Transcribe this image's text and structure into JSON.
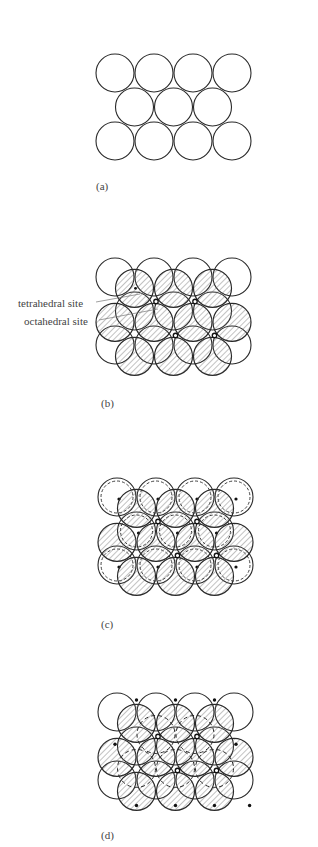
{
  "figure": {
    "panels": [
      {
        "id": "a",
        "label": "(a)",
        "description": "Single close-packed layer A of spheres"
      },
      {
        "id": "b",
        "label": "(b)",
        "description": "Second layer B (hatched) stacked on layer A, showing interstitial sites"
      },
      {
        "id": "c",
        "label": "(c)",
        "description": "Third layer (dashed) over the tetrahedral sites, dots mark sphere centers"
      },
      {
        "id": "d",
        "label": "(d)",
        "description": "Third layer (dashed) over the octahedral sites, dots mark sphere centers"
      }
    ],
    "annotations": {
      "tetrahedral": "tetrahedral site",
      "octahedral": "octahedral site"
    },
    "geometry": {
      "radius": 19,
      "dx": 39,
      "dy": 34,
      "panel_origins": [
        {
          "x": 115,
          "y": 73
        },
        {
          "x": 115,
          "y": 277
        },
        {
          "x": 117,
          "y": 497
        },
        {
          "x": 117,
          "y": 712
        }
      ]
    },
    "colors": {
      "stroke": "#2a2a2a",
      "hatch": "#555555",
      "text": "#444444"
    }
  }
}
